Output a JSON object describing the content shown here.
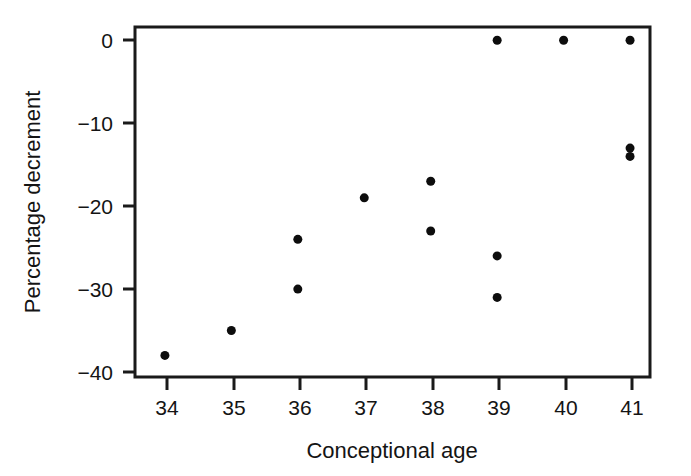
{
  "chart_data": {
    "type": "scatter",
    "title": "",
    "xlabel": "Conceptional age",
    "ylabel": "Percentage decrement",
    "xlim": [
      33.55,
      41.3
    ],
    "ylim": [
      -40.6,
      1.6
    ],
    "xticks": [
      34,
      35,
      36,
      37,
      38,
      39,
      40,
      41
    ],
    "xtick_labels": [
      "34",
      "35",
      "36",
      "37",
      "38",
      "39",
      "40",
      "41"
    ],
    "yticks": [
      0,
      -10,
      -20,
      -30,
      -40
    ],
    "ytick_labels": [
      "0",
      "−10",
      "−20",
      "−30",
      "−40"
    ],
    "grid": false,
    "legend": null,
    "marker": "filled-circle",
    "marker_color": "#0d0d0d",
    "marker_size_px": 9,
    "x": [
      34,
      35,
      36,
      36,
      37,
      38,
      38,
      39,
      39,
      39,
      40,
      41,
      41,
      41
    ],
    "y": [
      -38,
      -35,
      -24,
      -30,
      -19,
      -17,
      -23,
      0,
      -26,
      -31,
      0,
      0,
      -13,
      -14
    ],
    "points": [
      {
        "x": 34,
        "y": -38
      },
      {
        "x": 35,
        "y": -35
      },
      {
        "x": 36,
        "y": -24
      },
      {
        "x": 36,
        "y": -30
      },
      {
        "x": 37,
        "y": -19
      },
      {
        "x": 38,
        "y": -17
      },
      {
        "x": 38,
        "y": -23
      },
      {
        "x": 39,
        "y": 0
      },
      {
        "x": 39,
        "y": -26
      },
      {
        "x": 39,
        "y": -31
      },
      {
        "x": 40,
        "y": 0
      },
      {
        "x": 41,
        "y": 0
      },
      {
        "x": 41,
        "y": -13
      },
      {
        "x": 41,
        "y": -14
      }
    ],
    "axis_color": "#1a1a1a",
    "background_color": "#ffffff"
  },
  "figure": {
    "x_axis_title": "Conceptional age",
    "y_axis_title": "Percentage decrement"
  }
}
